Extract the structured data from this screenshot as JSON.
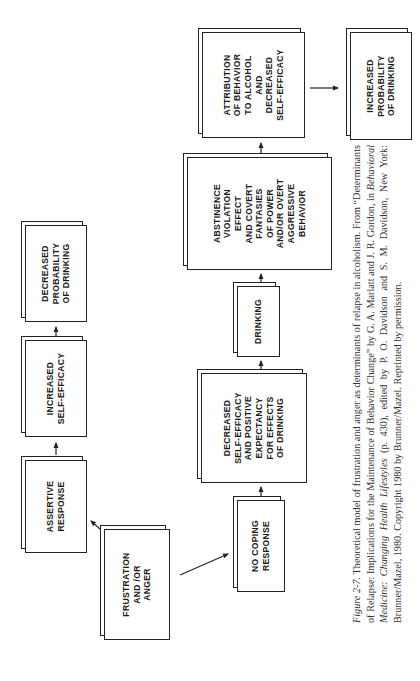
{
  "diagram": {
    "nodes": {
      "frustration": {
        "label": "FRUSTRATION\nAND /OR\nANGER"
      },
      "assertive": {
        "label": "ASSERTIVE\nRESPONSE"
      },
      "increased_self_efficacy": {
        "label": "INCREASED\nSELF-EFFICACY"
      },
      "decreased_probability": {
        "label": "DECREASED\nPROBABILITY\nOF DRINKING"
      },
      "no_coping": {
        "label": "NO COPING\nRESPONSE"
      },
      "decreased_self_efficacy": {
        "label": "DECREASED\nSELF-EFFICACY\nAND POSITIVE\nEXPECTANCY\nFOR EFFECTS\nOF DRINKING"
      },
      "drinking": {
        "label": "DRINKING"
      },
      "abstinence_violation": {
        "label": "ABSTINENCE\nVIOLATION\nEFFECT\nAND COVERT\nFANTASIES\nOF POWER\nAND/OR OVERT\nAGGRESSIVE\nBEHAVIOR"
      },
      "attribution": {
        "label": "ATTRIBUTION\nOF BEHAVIOR\nTO ALCOHOL\nAND\nDECREASED\nSELF-EFFICACY"
      },
      "increased_probability": {
        "label": "INCREASED\nPROBABILITY\nOF DRINKING"
      }
    },
    "edges": [
      [
        "frustration",
        "assertive"
      ],
      [
        "assertive",
        "increased_self_efficacy"
      ],
      [
        "increased_self_efficacy",
        "decreased_probability"
      ],
      [
        "frustration",
        "no_coping"
      ],
      [
        "no_coping",
        "decreased_self_efficacy"
      ],
      [
        "decreased_self_efficacy",
        "drinking"
      ],
      [
        "drinking",
        "abstinence_violation"
      ],
      [
        "abstinence_violation",
        "attribution"
      ],
      [
        "attribution",
        "increased_probability"
      ]
    ]
  },
  "caption": {
    "figure_label": "Figure 2-7.",
    "text_1": " Theoretical model of frustration and anger as determinants of relapse in alcoholism. From “Determinants of Relapse: Implications for the Maintenance of Behavior Change” by G. A. Marlatt and J. R. Gordon, in ",
    "book_title": "Behavioral Medicine: Changing Health Lifestyles",
    "text_2": " (p. 430), edited by P. O. Davidson and S. M. Davidson, New York: Brunner/Mazel, 1980. Copyright 1980 by Brunner/Mazel. Reprinted by permission."
  }
}
